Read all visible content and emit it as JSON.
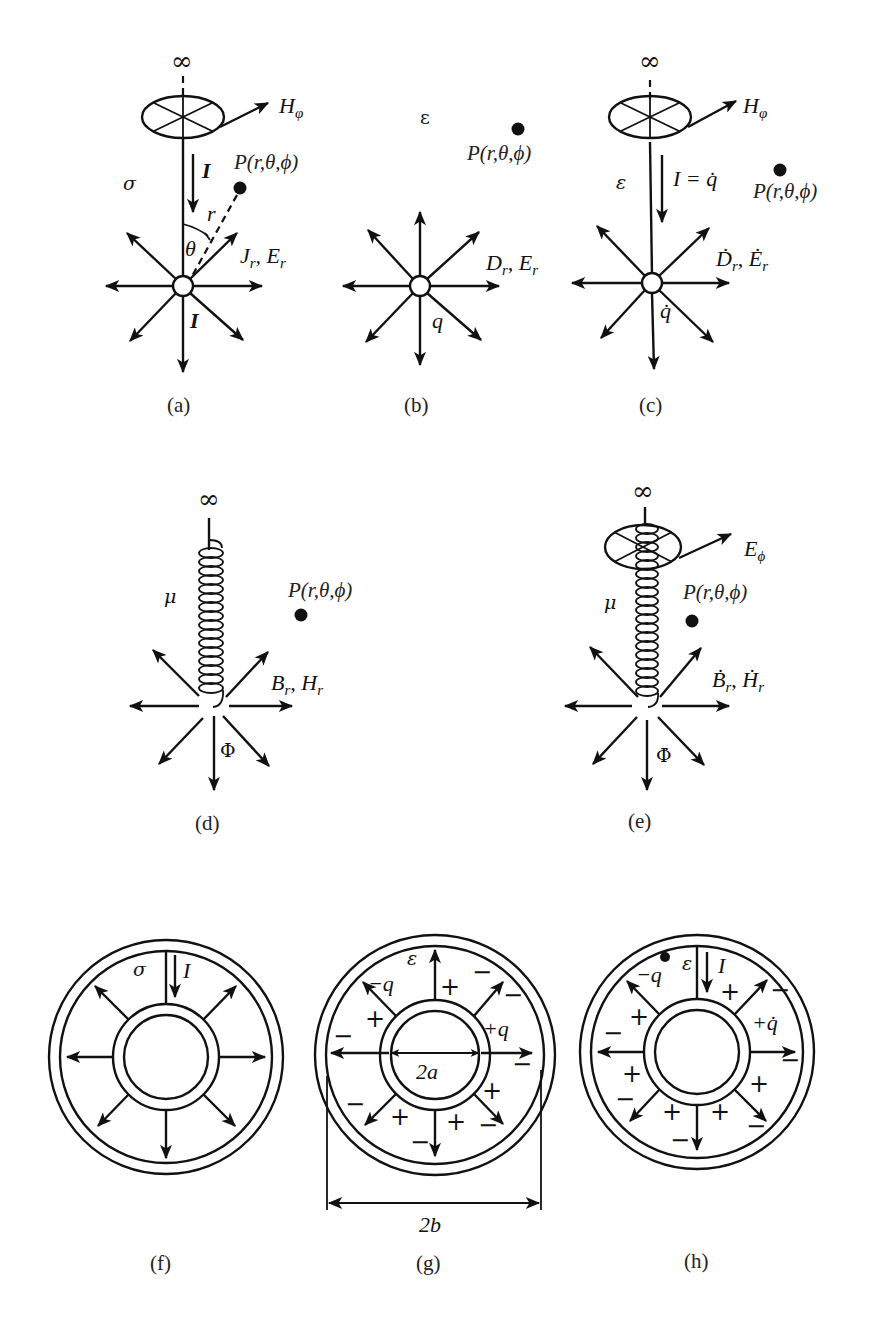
{
  "figure": {
    "panels": [
      {
        "id": "a",
        "caption": "(a)",
        "infinity": "∞",
        "field_label": "H",
        "field_sub": "φ",
        "current_label": "I",
        "current_bottom": "I",
        "medium": "σ",
        "point": "P(r,θ,ϕ)",
        "radius": "r",
        "angle": "θ",
        "radial_label": "J",
        "radial_sub": "r",
        "radial_label2": "E",
        "radial_sub2": "r"
      },
      {
        "id": "b",
        "caption": "(b)",
        "medium": "ε",
        "point": "P(r,θ,ϕ)",
        "charge": "q",
        "radial_label": "D",
        "radial_sub": "r",
        "radial_label2": "E",
        "radial_sub2": "r"
      },
      {
        "id": "c",
        "caption": "(c)",
        "infinity": "∞",
        "field_label": "H",
        "field_sub": "φ",
        "current_label": "I = q̇",
        "medium": "ε",
        "point": "P(r,θ,ϕ)",
        "charge": "q̇",
        "radial_label": "Ḋ",
        "radial_sub": "r",
        "radial_label2": "Ė",
        "radial_sub2": "r"
      },
      {
        "id": "d",
        "caption": "(d)",
        "infinity": "∞",
        "medium": "μ",
        "point": "P(r,θ,ϕ)",
        "flux": "Φ",
        "radial_label": "B",
        "radial_sub": "r",
        "radial_label2": "H",
        "radial_sub2": "r"
      },
      {
        "id": "e",
        "caption": "(e)",
        "infinity": "∞",
        "field_label": "E",
        "field_sub": "ϕ",
        "medium": "μ",
        "point": "P(r,θ,ϕ)",
        "flux": "Φ̇",
        "radial_label": "Ḃ",
        "radial_sub": "r",
        "radial_label2": "Ḣ",
        "radial_sub2": "r"
      },
      {
        "id": "f",
        "caption": "(f)",
        "medium": "σ",
        "current_label": "I"
      },
      {
        "id": "g",
        "caption": "(g)",
        "medium": "ε",
        "outer_charge": "−q",
        "inner_charge": "+q",
        "inner_dim": "2a",
        "outer_dim": "2b",
        "plus": "+",
        "minus": "−"
      },
      {
        "id": "h",
        "caption": "(h)",
        "medium": "ε",
        "current_label": "I",
        "outer_charge": "−q",
        "inner_charge": "+q̇",
        "plus": "+",
        "minus": "−"
      }
    ]
  }
}
